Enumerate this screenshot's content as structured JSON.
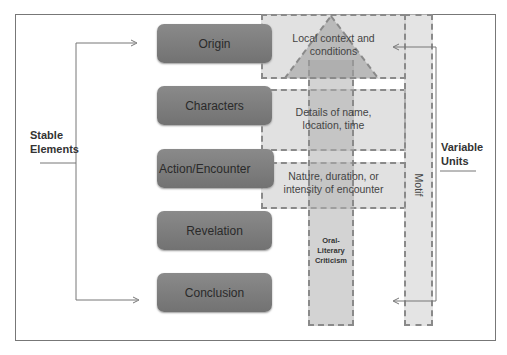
{
  "stable_elements": {
    "label_line1": "Stable",
    "label_line2": "Elements",
    "boxes": [
      {
        "label": "Origin"
      },
      {
        "label": "Characters"
      },
      {
        "label": "Action/Encounter"
      },
      {
        "label": "Revelation"
      },
      {
        "label": "Conclusion"
      }
    ]
  },
  "variable_units": {
    "label_line1": "Variable",
    "label_line2": "Units",
    "regions": [
      {
        "line1": "Local context and",
        "line2": "conditions"
      },
      {
        "line1": "Details of name,",
        "line2": "location, time"
      },
      {
        "line1": "Nature, duration, or",
        "line2": "intensity of encounter"
      }
    ],
    "motif_label": "Motif"
  },
  "arrow": {
    "line1": "Oral-",
    "line2": "Literary",
    "line3": "Criticism"
  },
  "colors": {
    "box_fill": "#7d7d7d",
    "dashed_fill": "#d0d0d0",
    "dash_stroke": "#8a8a8a",
    "line": "#777777"
  }
}
